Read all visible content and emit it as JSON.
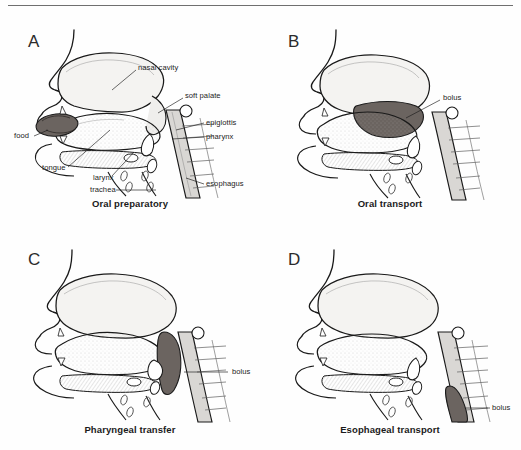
{
  "figure": {
    "background_color": "#fefefe",
    "rule_color": "#6f6f6f",
    "ink_color": "#1a1a1a",
    "bolus_fill_color": "#6b6460",
    "tissue_fill_color": "#f2f1ef"
  },
  "panels": [
    {
      "letter": "A",
      "caption": "Oral preparatory",
      "labels": [
        {
          "text": "nasal cavity",
          "x": 138,
          "y": 62
        },
        {
          "text": "soft palate",
          "x": 185,
          "y": 90
        },
        {
          "text": "epiglottis",
          "x": 206,
          "y": 117
        },
        {
          "text": "pharynx",
          "x": 206,
          "y": 131
        },
        {
          "text": "esophagus",
          "x": 206,
          "y": 178
        },
        {
          "text": "food",
          "x": 14,
          "y": 131
        },
        {
          "text": "tongue",
          "x": 42,
          "y": 164
        },
        {
          "text": "larynx",
          "x": 93,
          "y": 173
        },
        {
          "text": "trachea",
          "x": 90,
          "y": 184
        }
      ]
    },
    {
      "letter": "B",
      "caption": "Oral transport",
      "labels": [
        {
          "text": "bolus",
          "x": 443,
          "y": 92
        }
      ]
    },
    {
      "letter": "C",
      "caption": "Pharyngeal transfer",
      "labels": [
        {
          "text": "bolus",
          "x": 232,
          "y": 369
        }
      ]
    },
    {
      "letter": "D",
      "caption": "Esophageal transport",
      "labels": [
        {
          "text": "bolus",
          "x": 492,
          "y": 408
        }
      ]
    }
  ],
  "anatomy_terms": [
    "nasal cavity",
    "soft palate",
    "epiglottis",
    "pharynx",
    "esophagus",
    "food",
    "tongue",
    "larynx",
    "trachea",
    "bolus"
  ],
  "phase_sequence": [
    "Oral preparatory",
    "Oral transport",
    "Pharyngeal transfer",
    "Esophageal transport"
  ]
}
